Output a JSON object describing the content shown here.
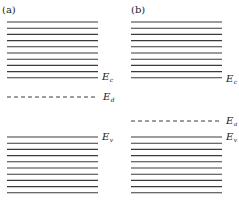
{
  "diagram": {
    "type": "energy-band-diagram",
    "panels": [
      {
        "label": "(a)",
        "conduction_band": {
          "label": "E",
          "subscript": "c",
          "line_count": 10
        },
        "impurity_level": {
          "label": "E",
          "subscript": "d",
          "style": "dashed",
          "position": "below conduction band"
        },
        "valence_band": {
          "label": "E",
          "subscript": "v",
          "line_count": 10
        }
      },
      {
        "label": "(b)",
        "conduction_band": {
          "label": "E",
          "subscript": "c",
          "line_count": 10
        },
        "impurity_level": {
          "label": "E",
          "subscript": "a",
          "style": "dashed",
          "position": "above valence band"
        },
        "valence_band": {
          "label": "E",
          "subscript": "v",
          "line_count": 10
        }
      }
    ]
  }
}
